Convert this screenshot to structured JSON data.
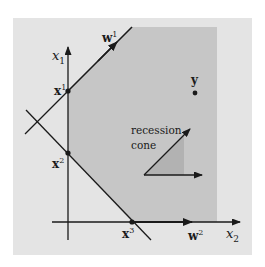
{
  "diagram": {
    "colors": {
      "background": "#ffffff",
      "outer_region": "#e4e4e4",
      "feasible_region": "#c6c6c6",
      "cone_fill": "#b4b4b4",
      "stroke": "#1a1a1a"
    },
    "axes": {
      "vertical_label": "x",
      "vertical_sub": "1",
      "horizontal_label": "x",
      "horizontal_sub": "2"
    },
    "points": [
      {
        "id": "x1",
        "label": "x",
        "sup": "1"
      },
      {
        "id": "x2",
        "label": "x",
        "sup": "2"
      },
      {
        "id": "x3",
        "label": "x",
        "sup": "3"
      },
      {
        "id": "y",
        "label": "y",
        "sup": ""
      }
    ],
    "directions": [
      {
        "id": "w1",
        "label": "w",
        "sup": "1"
      },
      {
        "id": "w2",
        "label": "w",
        "sup": "2"
      }
    ],
    "recession_cone": {
      "line1": "recession",
      "line2": "cone"
    }
  }
}
